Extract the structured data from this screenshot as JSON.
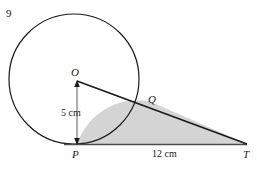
{
  "figure": {
    "question_number": "9",
    "points": {
      "center_label": "O",
      "tangent_label": "P",
      "intersection_label": "Q",
      "external_label": "T"
    },
    "measurements": {
      "radius": "5 cm",
      "base": "12 cm"
    },
    "colors": {
      "stroke": "#1a1a1a",
      "shaded_region": "#d4d4d4",
      "baseline": "#4d4d4d",
      "background": "#ffffff"
    },
    "geometry": {
      "circle_center_x": 74,
      "circle_center_y": 79,
      "circle_radius": 65,
      "point_P_x": 77,
      "point_P_y": 144,
      "point_Q_x": 149,
      "point_Q_y": 101,
      "point_T_x": 247,
      "point_T_y": 144
    }
  }
}
